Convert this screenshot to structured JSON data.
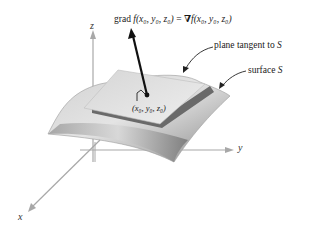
{
  "figure": {
    "type": "3d-surface-tangent-plane-diagram",
    "axes": {
      "x_label": "x",
      "y_label": "y",
      "z_label": "z"
    },
    "gradient_label": {
      "prefix": "grad ",
      "lhs": "f(x₀, y₀, z₀)",
      "equals": " = ",
      "nabla": "∇",
      "rhs": "f(x₀, y₀, z₀)"
    },
    "callouts": {
      "tangent_plane_text": "plane tangent to ",
      "tangent_plane_symbol": "S",
      "surface_text": "surface ",
      "surface_symbol": "S"
    },
    "point_label": "(x₀, y₀, z₀)",
    "colors": {
      "axis": "#a8a8a8",
      "surface_light": "#d8d8d8",
      "surface_dark": "#8a8a8a",
      "plane": "#e8e8e8",
      "plane_edge_shadow": "#666666",
      "vector": "#111111",
      "text": "#1a1a1a"
    }
  }
}
